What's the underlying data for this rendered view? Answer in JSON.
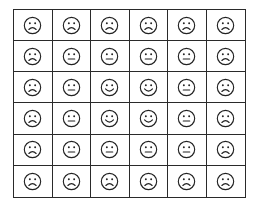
{
  "grid": {
    "rows": 6,
    "cols": 6,
    "line_color": "#2a2a2a",
    "face_color": "#222222",
    "legend": {
      "S": "sad-face",
      "N": "neutral-face",
      "H": "happy-face"
    },
    "cells": [
      [
        "S",
        "S",
        "S",
        "S",
        "S",
        "S"
      ],
      [
        "S",
        "N",
        "N",
        "N",
        "N",
        "S"
      ],
      [
        "S",
        "N",
        "H",
        "H",
        "N",
        "S"
      ],
      [
        "S",
        "N",
        "H",
        "H",
        "N",
        "S"
      ],
      [
        "S",
        "N",
        "N",
        "N",
        "N",
        "S"
      ],
      [
        "S",
        "S",
        "S",
        "S",
        "S",
        "S"
      ]
    ]
  }
}
